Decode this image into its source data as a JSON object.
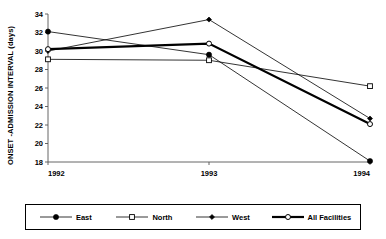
{
  "chart_data": {
    "type": "line",
    "title": "",
    "xlabel": "",
    "ylabel": "ONSET -ADMISSION INTERVAL  (days)",
    "x": [
      "1992",
      "1993",
      "1994"
    ],
    "categories": [
      "1992",
      "1993",
      "1994"
    ],
    "ylim": [
      18,
      34
    ],
    "yticks": [
      "18",
      "20",
      "22",
      "24",
      "26",
      "28",
      "30",
      "32",
      "34"
    ],
    "xticks": [
      "1992",
      "1993",
      "1994"
    ],
    "grid": false,
    "legend_position": "bottom",
    "series": [
      {
        "name": "East",
        "values": [
          32.1,
          29.6,
          18.1
        ],
        "marker": "filled-circle",
        "color": "#000000",
        "line_width": 0.8
      },
      {
        "name": "North",
        "values": [
          29.1,
          29.0,
          26.2
        ],
        "marker": "open-square",
        "color": "#000000",
        "line_width": 0.8
      },
      {
        "name": "West",
        "values": [
          30.0,
          33.4,
          22.7
        ],
        "marker": "small-filled-diamond",
        "color": "#000000",
        "line_width": 0.8
      },
      {
        "name": "All Facilities",
        "values": [
          30.2,
          30.8,
          22.1
        ],
        "marker": "open-circle",
        "color": "#000000",
        "line_width": 2.2
      }
    ]
  },
  "legend": {
    "items": [
      {
        "label": "East"
      },
      {
        "label": "North"
      },
      {
        "label": "West"
      },
      {
        "label": "All Facilities"
      }
    ]
  },
  "axis": {
    "y_title": "ONSET -ADMISSION INTERVAL  (days)"
  }
}
